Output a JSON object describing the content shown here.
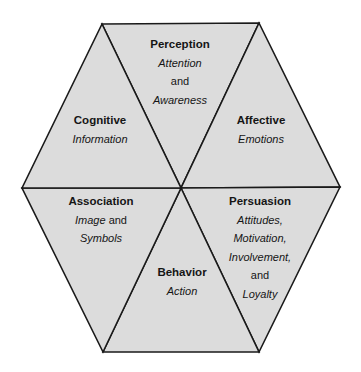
{
  "diagram": {
    "type": "hexagon",
    "colors": {
      "fill": "#dcdcdc",
      "stroke": "#1a1a1a",
      "text": "#151515",
      "background": "#ffffff"
    },
    "segments": [
      {
        "id": "perception",
        "title": "Perception",
        "lines": [
          {
            "text": "Attention",
            "italic": true
          },
          {
            "text": "and",
            "italic": false
          },
          {
            "text": "Awareness",
            "italic": true
          }
        ]
      },
      {
        "id": "affective",
        "title": "Affective",
        "lines": [
          {
            "text": "Emotions",
            "italic": true
          }
        ]
      },
      {
        "id": "persuasion",
        "title": "Persuasion",
        "lines": [
          {
            "text": "Attitudes,",
            "italic": true
          },
          {
            "text": "Motivation,",
            "italic": true
          },
          {
            "text": "Involvement,",
            "italic": true
          },
          {
            "text": "and",
            "italic": false
          },
          {
            "text": "Loyalty",
            "italic": true
          }
        ]
      },
      {
        "id": "behavior",
        "title": "Behavior",
        "lines": [
          {
            "text": "Action",
            "italic": true
          }
        ]
      },
      {
        "id": "association",
        "title": "Association",
        "lines": [
          {
            "text": "Image",
            "italic": true,
            "suffix": " and"
          },
          {
            "text": "Symbols",
            "italic": true
          }
        ]
      },
      {
        "id": "cognitive",
        "title": "Cognitive",
        "lines": [
          {
            "text": "Information",
            "italic": true
          }
        ]
      }
    ]
  }
}
